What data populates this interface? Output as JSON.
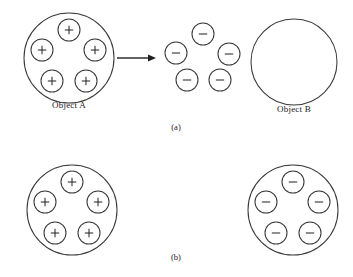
{
  "figure": {
    "type": "physics-charge-diagram",
    "background_color": "#ffffff",
    "stroke_color": "#3a3a3a",
    "text_color": "#181818",
    "width": 353,
    "height": 277
  },
  "labels": {
    "object_a": "Object A",
    "object_b": "Object B",
    "caption_a": "(a)",
    "caption_b": "(b)"
  },
  "symbols": {
    "positive": "+",
    "negative": "−",
    "arrow": "rightwards-arrow"
  },
  "panels": [
    {
      "id": "a",
      "caption": "(a)",
      "caption_position": {
        "x": 176,
        "y": 126
      },
      "groups": [
        {
          "name": "object-a",
          "label": "Object A",
          "label_position": {
            "x": 69,
            "y": 104
          },
          "shell": {
            "cx": 69,
            "cy": 58,
            "r": 45
          },
          "charge_sign": "+",
          "charge_radius": 11,
          "charges": [
            {
              "cx": 69,
              "cy": 30,
              "sign": "+"
            },
            {
              "cx": 42,
              "cy": 50,
              "sign": "+"
            },
            {
              "cx": 95,
              "cy": 50,
              "sign": "+"
            },
            {
              "cx": 52,
              "cy": 81,
              "sign": "+"
            },
            {
              "cx": 86,
              "cy": 81,
              "sign": "+"
            }
          ]
        },
        {
          "name": "free-charges",
          "label": "",
          "shell": null,
          "charge_sign": "−",
          "charge_radius": 11,
          "charges": [
            {
              "cx": 203,
              "cy": 34,
              "sign": "−"
            },
            {
              "cx": 176,
              "cy": 53,
              "sign": "−"
            },
            {
              "cx": 229,
              "cy": 54,
              "sign": "−"
            },
            {
              "cx": 187,
              "cy": 80,
              "sign": "−"
            },
            {
              "cx": 220,
              "cy": 80,
              "sign": "−"
            }
          ]
        },
        {
          "name": "object-b",
          "label": "Object B",
          "label_position": {
            "x": 294,
            "y": 108
          },
          "shell": {
            "cx": 294,
            "cy": 62,
            "r": 43
          },
          "charge_sign": null,
          "charge_radius": 11,
          "charges": []
        }
      ],
      "arrow": {
        "x1": 117,
        "y1": 58,
        "x2": 156,
        "y2": 58
      }
    },
    {
      "id": "b",
      "caption": "(b)",
      "caption_position": {
        "x": 176,
        "y": 256
      },
      "groups": [
        {
          "name": "object-b-left",
          "label": "",
          "shell": {
            "cx": 72,
            "cy": 210,
            "r": 45
          },
          "charge_sign": "+",
          "charge_radius": 11,
          "charges": [
            {
              "cx": 72,
              "cy": 182,
              "sign": "+"
            },
            {
              "cx": 45,
              "cy": 202,
              "sign": "+"
            },
            {
              "cx": 98,
              "cy": 202,
              "sign": "+"
            },
            {
              "cx": 55,
              "cy": 233,
              "sign": "+"
            },
            {
              "cx": 89,
              "cy": 233,
              "sign": "+"
            }
          ]
        },
        {
          "name": "object-b-right",
          "label": "",
          "shell": {
            "cx": 293,
            "cy": 210,
            "r": 45
          },
          "charge_sign": "−",
          "charge_radius": 11,
          "charges": [
            {
              "cx": 293,
              "cy": 182,
              "sign": "−"
            },
            {
              "cx": 266,
              "cy": 202,
              "sign": "−"
            },
            {
              "cx": 319,
              "cy": 202,
              "sign": "−"
            },
            {
              "cx": 276,
              "cy": 233,
              "sign": "−"
            },
            {
              "cx": 310,
              "cy": 233,
              "sign": "−"
            }
          ]
        }
      ],
      "arrow": null
    }
  ]
}
